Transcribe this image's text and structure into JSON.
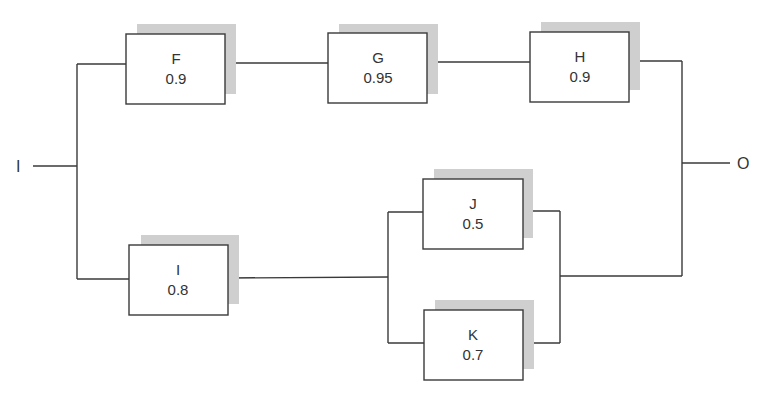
{
  "diagram": {
    "type": "reliability-block-diagram",
    "input": {
      "label": "I"
    },
    "output": {
      "label": "O"
    },
    "colors": {
      "line": "#3a3a3a",
      "box_fill": "#ffffff",
      "shadow": "#cfcfcf",
      "text": "#333333"
    },
    "blocks": [
      {
        "id": "F",
        "name": "F",
        "reliability": "0.9"
      },
      {
        "id": "G",
        "name": "G",
        "reliability": "0.95"
      },
      {
        "id": "H",
        "name": "H",
        "reliability": "0.9"
      },
      {
        "id": "I",
        "name": "I",
        "reliability": "0.8"
      },
      {
        "id": "J",
        "name": "J",
        "reliability": "0.5"
      },
      {
        "id": "K",
        "name": "K",
        "reliability": "0.7"
      }
    ],
    "structure": {
      "top_branch_series": [
        "F",
        "G",
        "H"
      ],
      "bottom_branch": {
        "series_first": "I",
        "then_parallel": [
          "J",
          "K"
        ]
      },
      "branches_in_parallel": true
    }
  }
}
